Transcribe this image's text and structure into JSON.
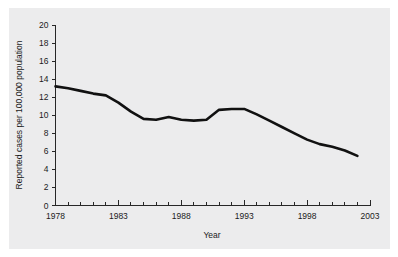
{
  "chart_data": {
    "type": "line",
    "title": "",
    "xlabel": "Year",
    "ylabel": "Reported cases per 100,000 population",
    "xlim": [
      1978,
      2003
    ],
    "ylim": [
      0,
      20
    ],
    "grid": false,
    "legend": false,
    "x_major_ticks": [
      1978,
      1983,
      1988,
      1993,
      1998,
      2003
    ],
    "x_major_tick_labels": [
      "1978",
      "1983",
      "1988",
      "1993",
      "1998",
      "2003"
    ],
    "x_minor_tick_step": 1,
    "y_ticks": [
      0,
      2,
      4,
      6,
      8,
      10,
      12,
      14,
      16,
      18,
      20
    ],
    "y_tick_labels": [
      "0",
      "2",
      "4",
      "6",
      "8",
      "10",
      "12",
      "14",
      "16",
      "18",
      "20"
    ],
    "series": [
      {
        "name": "Reported cases per 100,000 population",
        "color": "#111111",
        "x": [
          1978,
          1979,
          1980,
          1981,
          1982,
          1983,
          1984,
          1985,
          1986,
          1987,
          1988,
          1989,
          1990,
          1991,
          1992,
          1993,
          1994,
          1995,
          1996,
          1997,
          1998,
          1999,
          2000,
          2001,
          2002
        ],
        "values": [
          13.2,
          13.0,
          12.7,
          12.4,
          12.2,
          11.4,
          10.4,
          9.6,
          9.5,
          9.8,
          9.5,
          9.4,
          9.5,
          10.6,
          10.7,
          10.7,
          10.1,
          9.4,
          8.7,
          8.0,
          7.3,
          6.8,
          6.5,
          6.1,
          5.5
        ]
      }
    ]
  },
  "axes": {
    "x_axis_title": "Year",
    "y_axis_title": "Reported cases per 100,000 population"
  },
  "colors": {
    "panel_background": "#ececed",
    "figure_background": "#ffffff",
    "line": "#111111",
    "axis": "#272727",
    "text": "#1b1b1b"
  }
}
